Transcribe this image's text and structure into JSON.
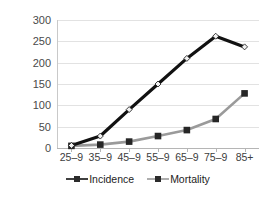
{
  "chart_data": {
    "type": "line",
    "title": "",
    "subtitle": "",
    "xlabel": "",
    "ylabel": "",
    "categories": [
      "25–9",
      "35–9",
      "45–9",
      "55–9",
      "65–9",
      "75–9",
      "85+"
    ],
    "series": [
      {
        "name": "Incidence",
        "values": [
          6,
          28,
          90,
          150,
          210,
          262,
          237
        ],
        "color": "#111111",
        "marker": "diamond",
        "marker_fill": "#f2f2f2"
      },
      {
        "name": "Mortality",
        "values": [
          5,
          8,
          15,
          28,
          42,
          68,
          128
        ],
        "color": "#9a9a9a",
        "marker": "square",
        "marker_fill": "#262626"
      }
    ],
    "ylim": [
      0,
      300
    ],
    "yticks": [
      0,
      50,
      100,
      150,
      200,
      250,
      300
    ],
    "ytick_labels": [
      "0",
      "50",
      "100",
      "150",
      "200",
      "250",
      "300"
    ],
    "grid": true,
    "grid_axis": "y",
    "legend_position": "bottom"
  },
  "legend": {
    "entries": [
      {
        "label": "Incidence"
      },
      {
        "label": "Mortality"
      }
    ]
  },
  "colors": {
    "background": "#ffffff",
    "gridline": "#e2e2e2",
    "axis": "#b5b5b5",
    "tick_text": "#4a4a4a",
    "incidence": "#111111",
    "mortality": "#9a9a9a"
  }
}
